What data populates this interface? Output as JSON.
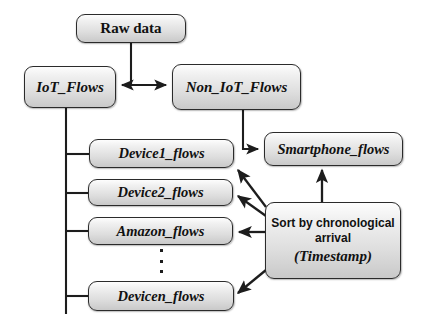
{
  "diagram": {
    "nodes": {
      "raw_data": {
        "label": "Raw data"
      },
      "iot_flows": {
        "label": "IoT_Flows"
      },
      "non_iot_flows": {
        "label": "Non_IoT_Flows"
      },
      "smartphone_flows": {
        "label": "Smartphone_flows"
      },
      "device1_flows": {
        "label": "Device1_flows"
      },
      "device2_flows": {
        "label": "Device2_flows"
      },
      "amazon_flows": {
        "label": "Amazon_flows"
      },
      "devicen_flows": {
        "label": "Devicen_flows"
      },
      "sort_box": {
        "line1": "Sort by chronological arrival",
        "line2": "(Timestamp)"
      }
    },
    "ellipsis": "⋮",
    "colors": {
      "node_fill_top": "#fdfdfd",
      "node_fill_bottom": "#c9c9c9",
      "node_border": "#2b2b2b",
      "edge": "#1d1d1d",
      "background": "#ffffff"
    },
    "edges": [
      {
        "name": "raw-data-to-split",
        "from": "raw_data",
        "to": "split-junction",
        "arrow": "none"
      },
      {
        "name": "split-to-iot-flows",
        "from": "split-junction",
        "to": "iot_flows",
        "arrow": "single"
      },
      {
        "name": "split-to-non-iot-flows",
        "from": "split-junction",
        "to": "non_iot_flows",
        "arrow": "single"
      },
      {
        "name": "non-iot-flows-to-smartphone-flows",
        "from": "non_iot_flows",
        "to": "smartphone_flows",
        "arrow": "single"
      },
      {
        "name": "iot-flows-tree-trunk",
        "from": "iot_flows",
        "to": "device-branches",
        "arrow": "none"
      },
      {
        "name": "trunk-to-device1-flows",
        "from": "iot_flows",
        "to": "device1_flows",
        "arrow": "none"
      },
      {
        "name": "trunk-to-device2-flows",
        "from": "iot_flows",
        "to": "device2_flows",
        "arrow": "none"
      },
      {
        "name": "trunk-to-amazon-flows",
        "from": "iot_flows",
        "to": "amazon_flows",
        "arrow": "none"
      },
      {
        "name": "trunk-to-devicen-flows",
        "from": "iot_flows",
        "to": "devicen_flows",
        "arrow": "none"
      },
      {
        "name": "sort-box-to-smartphone-flows",
        "from": "sort_box",
        "to": "smartphone_flows",
        "arrow": "single"
      },
      {
        "name": "sort-box-to-device1-flows",
        "from": "sort_box",
        "to": "device1_flows",
        "arrow": "single"
      },
      {
        "name": "sort-box-to-device2-flows",
        "from": "sort_box",
        "to": "device2_flows",
        "arrow": "single"
      },
      {
        "name": "sort-box-to-amazon-flows",
        "from": "sort_box",
        "to": "amazon_flows",
        "arrow": "single"
      },
      {
        "name": "sort-box-to-devicen-flows",
        "from": "sort_box",
        "to": "devicen_flows",
        "arrow": "single"
      }
    ]
  }
}
